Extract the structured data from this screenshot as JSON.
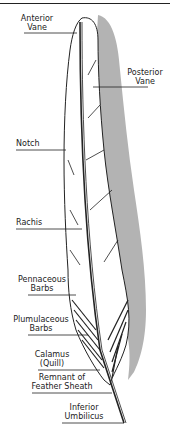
{
  "diagram": {
    "labels": {
      "anterior_vane": [
        "Anterior",
        "Vane"
      ],
      "posterior_vane": [
        "Posterior",
        "Vane"
      ],
      "notch": "Notch",
      "rachis": "Rachis",
      "pennaceous_barbs": [
        "Pennaceous",
        "Barbs"
      ],
      "plumulaceous_barbs": [
        "Plumulaceous",
        "Barbs"
      ],
      "calamus": [
        "Calamus",
        "(Quill)"
      ],
      "remnant": [
        "Remnant of",
        "Feather Sheath"
      ],
      "inferior_umbilicus": [
        "Inferior",
        "Umbilicus"
      ]
    },
    "colors": {
      "outline": "#222222",
      "shadow": "#b3b3b3",
      "fill": "#ffffff"
    }
  }
}
